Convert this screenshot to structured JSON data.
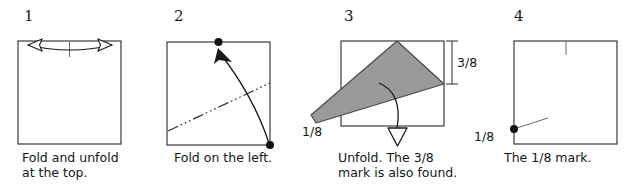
{
  "figure": {
    "colors": {
      "paper_outline": "#3a3a3a",
      "flap_fill": "#9a9a9a",
      "flap_outline": "#4a4a4a",
      "crease_line": "#2b2b2b",
      "arrow": "#1a1a1a",
      "text": "#161616",
      "background": "#ffffff"
    },
    "panels": [
      {
        "number": "1",
        "caption": "Fold and unfold\nat the top.",
        "icons": [
          "square-paper",
          "double-headed-fold-arrow",
          "center-tick-mark"
        ],
        "labels": []
      },
      {
        "number": "2",
        "caption": "Fold on the left.",
        "icons": [
          "square-paper",
          "reference-dot-top-center",
          "reference-dot-bottom-right",
          "curved-fold-arrow",
          "dash-dot-crease-line"
        ],
        "labels": []
      },
      {
        "number": "3",
        "caption": "Unfold. The 3/8\nmark is also found.",
        "icons": [
          "square-paper",
          "gray-folded-flap",
          "unfold-arrow-hollow",
          "measure-bracket-right"
        ],
        "labels": [
          {
            "name": "three-eighths",
            "text": "3/8"
          },
          {
            "name": "one-eighth",
            "text": "1/8"
          }
        ]
      },
      {
        "number": "4",
        "caption": "The 1/8 mark.",
        "icons": [
          "square-paper",
          "center-tick-mark",
          "reference-dot-left-edge",
          "leader-line"
        ],
        "labels": [
          {
            "name": "one-eighth",
            "text": "1/8"
          }
        ]
      }
    ]
  }
}
